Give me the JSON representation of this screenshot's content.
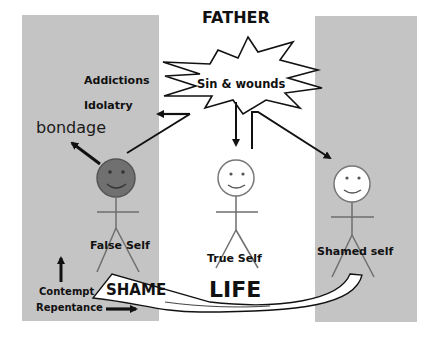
{
  "diagram": {
    "title": "FATHER",
    "source_burst": {
      "label": "Sin & wounds",
      "shape": "starburst"
    },
    "outcomes": {
      "addictions": "Addictions",
      "idolatry": "Idolatry",
      "bondage": "bondage"
    },
    "figures": [
      {
        "id": "false-self",
        "label": "False Self",
        "face_color": "#707070",
        "background": "gray-panel"
      },
      {
        "id": "true-self",
        "label": "True Self",
        "face_color": "#ffffff",
        "background": "white"
      },
      {
        "id": "shamed-self",
        "label": "Shamed self",
        "face_color": "#ffffff",
        "background": "gray-panel"
      }
    ],
    "bottom": {
      "contempt": "Contempt",
      "repentance": "Repentance",
      "shame": "SHAME",
      "life": "LIFE"
    },
    "arrows": [
      {
        "from": "Sin & wounds",
        "to": "Idolatry"
      },
      {
        "from": "Idolatry",
        "to": "False Self"
      },
      {
        "from": "False Self",
        "to": "bondage"
      },
      {
        "from": "Sin & wounds",
        "to": "True Self"
      },
      {
        "from": "Sin & wounds",
        "to": "Shamed self"
      },
      {
        "from": "Shamed self",
        "to": "SHAME",
        "style": "curved-band"
      },
      {
        "from": "Contempt",
        "direction": "up"
      },
      {
        "from": "Repentance",
        "direction": "right"
      }
    ],
    "colors": {
      "panel": "#c4c4c4",
      "background": "#ffffff",
      "ink": "#111111",
      "figure_line": "#6e6e6e",
      "false_self_face": "#707070"
    }
  }
}
